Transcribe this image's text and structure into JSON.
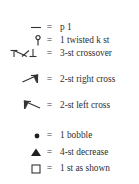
{
  "legend": {
    "title": "Knitting chart symbol key",
    "equals_sign": "=",
    "rows": [
      {
        "symbol": "purl-dash-symbol",
        "label": "p 1"
      },
      {
        "symbol": "twisted-knit-stitch-symbol",
        "label": "1 twisted k st"
      },
      {
        "symbol": "three-stitch-crossover-symbol",
        "label": "3-st crossover"
      },
      {
        "symbol": "two-stitch-right-cross-symbol",
        "label": "2-st right cross"
      },
      {
        "symbol": "two-stitch-left-cross-symbol",
        "label": "2-st left cross"
      },
      {
        "symbol": "bobble-dot-symbol",
        "label": "1 bobble"
      },
      {
        "symbol": "four-stitch-decrease-triangle-symbol",
        "label": "4-st decrease"
      },
      {
        "symbol": "stitch-as-shown-square-symbol",
        "label": "1 st as shown"
      }
    ]
  },
  "colors": {
    "background": "#ffffff",
    "ink": "#2a2a2a",
    "stroke": "#333333"
  }
}
